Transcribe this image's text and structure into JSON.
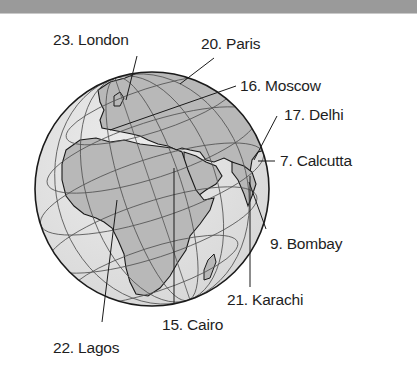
{
  "figure": {
    "type": "globe-map",
    "colors": {
      "ocean": "#e2e2e2",
      "land": "#b9b9b9",
      "outline": "#1a1a1a",
      "grid": "#555555",
      "header_bar": "#9a9a9a"
    }
  },
  "labels": [
    {
      "id": "london",
      "text": "23. London"
    },
    {
      "id": "paris",
      "text": "20. Paris"
    },
    {
      "id": "moscow",
      "text": "16. Moscow"
    },
    {
      "id": "delhi",
      "text": "17. Delhi"
    },
    {
      "id": "calcutta",
      "text": "7. Calcutta"
    },
    {
      "id": "bombay",
      "text": "9. Bombay"
    },
    {
      "id": "karachi",
      "text": "21. Karachi"
    },
    {
      "id": "cairo",
      "text": "15. Cairo"
    },
    {
      "id": "lagos",
      "text": "22. Lagos"
    }
  ]
}
